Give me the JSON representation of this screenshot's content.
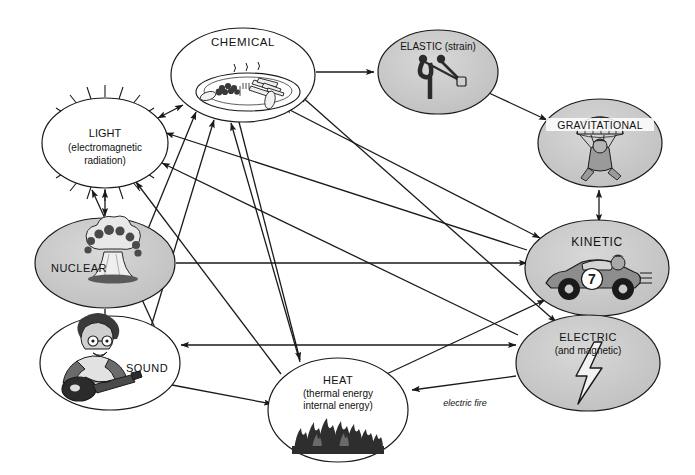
{
  "diagram": {
    "background_color": "#ffffff",
    "line_color": "#1a1a1a",
    "shaded_fill": "#c8c8c8",
    "plain_fill": "#ffffff",
    "nodes": [
      {
        "id": "chemical",
        "label": "CHEMICAL",
        "label_lines": [
          "CHEMICAL"
        ],
        "icon": "plate-of-food-icon",
        "fill": "#ffffff",
        "cx": 243,
        "cy": 75,
        "rx": 72,
        "ry": 47
      },
      {
        "id": "elastic",
        "label": "ELASTIC (strain)",
        "label_lines": [
          "ELASTIC (strain)"
        ],
        "icon": "slingshot-icon",
        "fill": "#c8c8c8",
        "cx": 438,
        "cy": 72,
        "rx": 60,
        "ry": 42
      },
      {
        "id": "gravitational",
        "label": "GRAVITATIONAL",
        "label_lines": [
          "GRAVITATIONAL"
        ],
        "icon": "parachutist-icon",
        "fill": "#c8c8c8",
        "cx": 600,
        "cy": 143,
        "rx": 62,
        "ry": 44
      },
      {
        "id": "light",
        "label": "LIGHT (electromagnetic radiation)",
        "label_lines": [
          "LIGHT",
          "(electromagnetic",
          "radiation)"
        ],
        "icon": "radiating-rays-icon",
        "fill": "#ffffff",
        "cx": 105,
        "cy": 143,
        "rx": 63,
        "ry": 45
      },
      {
        "id": "nuclear",
        "label": "NUCLEAR",
        "label_lines": [
          "NUCLEAR"
        ],
        "icon": "mushroom-cloud-icon",
        "fill": "#c8c8c8",
        "cx": 105,
        "cy": 263,
        "rx": 70,
        "ry": 45
      },
      {
        "id": "kinetic",
        "label": "KINETIC",
        "label_lines": [
          "KINETIC"
        ],
        "icon": "race-car-icon",
        "fill": "#c8c8c8",
        "cx": 597,
        "cy": 268,
        "rx": 72,
        "ry": 48
      },
      {
        "id": "sound",
        "label": "SOUND",
        "label_lines": [
          "SOUND"
        ],
        "icon": "guitarist-icon",
        "fill": "#ffffff",
        "cx": 110,
        "cy": 363,
        "rx": 70,
        "ry": 47
      },
      {
        "id": "electric",
        "label": "ELECTRIC (and magnetic)",
        "label_lines": [
          "ELECTRIC",
          "(and magnetic)"
        ],
        "icon": "lightning-bolt-icon",
        "fill": "#c8c8c8",
        "cx": 588,
        "cy": 363,
        "rx": 72,
        "ry": 48
      },
      {
        "id": "heat",
        "label": "HEAT (thermal energy internal energy)",
        "label_lines": [
          "HEAT",
          "(thermal energy",
          "internal energy)"
        ],
        "icon": "flames-icon",
        "fill": "#ffffff",
        "cx": 338,
        "cy": 410,
        "rx": 70,
        "ry": 52
      }
    ],
    "edges": [
      {
        "from": "chemical",
        "to": "elastic",
        "arrow": "single",
        "label": ""
      },
      {
        "from": "elastic",
        "to": "gravitational",
        "arrow": "single",
        "label": ""
      },
      {
        "from": "gravitational",
        "to": "kinetic",
        "arrow": "double",
        "label": ""
      },
      {
        "from": "nuclear",
        "to": "light",
        "arrow": "double",
        "label": ""
      },
      {
        "from": "nuclear",
        "to": "sound",
        "arrow": "single",
        "label": ""
      },
      {
        "from": "nuclear",
        "to": "kinetic",
        "arrow": "single",
        "label": ""
      },
      {
        "from": "nuclear",
        "to": "chemical",
        "arrow": "single",
        "label": ""
      },
      {
        "from": "chemical",
        "to": "light",
        "arrow": "double",
        "label": ""
      },
      {
        "from": "chemical",
        "to": "heat",
        "arrow": "single",
        "label": ""
      },
      {
        "from": "chemical",
        "to": "kinetic",
        "arrow": "double",
        "label": ""
      },
      {
        "from": "chemical",
        "to": "electric",
        "arrow": "double",
        "label": ""
      },
      {
        "from": "sound",
        "to": "chemical",
        "arrow": "single",
        "label": ""
      },
      {
        "from": "sound",
        "to": "light",
        "arrow": "single",
        "label": ""
      },
      {
        "from": "sound",
        "to": "electric",
        "arrow": "double",
        "label": ""
      },
      {
        "from": "sound",
        "to": "heat",
        "arrow": "single",
        "label": ""
      },
      {
        "from": "heat",
        "to": "chemical",
        "arrow": "single",
        "label": ""
      },
      {
        "from": "heat",
        "to": "light",
        "arrow": "single",
        "label": ""
      },
      {
        "from": "heat",
        "to": "kinetic",
        "arrow": "double",
        "label": ""
      },
      {
        "from": "electric",
        "to": "heat",
        "arrow": "single",
        "label": "electric fire"
      },
      {
        "from": "electric",
        "to": "kinetic",
        "arrow": "double",
        "label": ""
      },
      {
        "from": "electric",
        "to": "light",
        "arrow": "single",
        "label": ""
      },
      {
        "from": "kinetic",
        "to": "light",
        "arrow": "single",
        "label": ""
      }
    ],
    "edge_labels": [
      {
        "id": "electric-fire",
        "text": "electric fire",
        "x": 465,
        "y": 405
      }
    ]
  }
}
